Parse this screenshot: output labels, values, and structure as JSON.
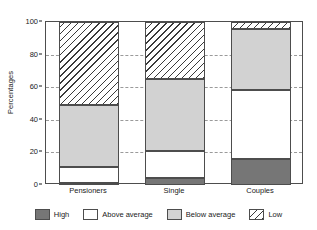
{
  "chart_data": {
    "type": "bar",
    "subtype": "stacked-bar-100",
    "title": "",
    "xlabel": "",
    "ylabel": "Percentages",
    "ylim": [
      0,
      100
    ],
    "yticks": [
      0,
      20,
      40,
      60,
      80,
      100
    ],
    "ytick_labels": [
      "0",
      "20",
      "40",
      "60",
      "80",
      "100"
    ],
    "grid": "horizontal-dashed",
    "legend_position": "bottom",
    "categories": [
      "Pensioners",
      "Single",
      "Couples"
    ],
    "series": [
      {
        "name": "High",
        "color": "#767676",
        "fill": "solid",
        "values": [
          1,
          4,
          16
        ]
      },
      {
        "name": "Above average",
        "color": "#ffffff",
        "fill": "solid",
        "values": [
          10,
          17,
          42
        ]
      },
      {
        "name": "Below average",
        "color": "#d2d2d2",
        "fill": "solid",
        "values": [
          38,
          44,
          38
        ]
      },
      {
        "name": "Low",
        "color": "#ffffff",
        "fill": "hatched-diagonal",
        "values": [
          51,
          35,
          4
        ]
      }
    ],
    "stack_boundaries": {
      "Pensioners": [
        0,
        1,
        11,
        49,
        100
      ],
      "Single": [
        0,
        4,
        21,
        65,
        100
      ],
      "Couples": [
        0,
        16,
        58,
        96,
        100
      ]
    }
  },
  "legend": {
    "items": [
      {
        "label": "High"
      },
      {
        "label": "Above average"
      },
      {
        "label": "Below average"
      },
      {
        "label": "Low"
      }
    ]
  }
}
